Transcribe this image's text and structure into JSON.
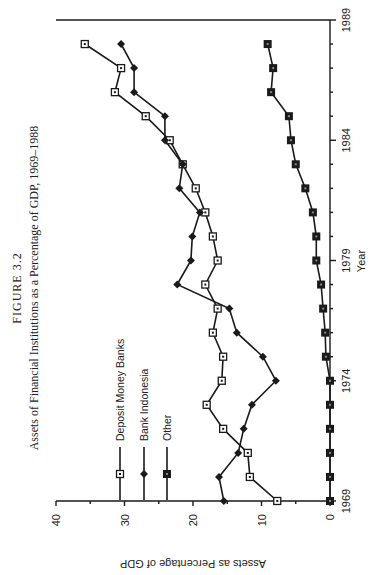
{
  "figure": {
    "number": "FIGURE 3.2",
    "caption": "Assets of Financial Institutions as a Percentage of GDP, 1969–1988"
  },
  "legend": [
    {
      "label": "Deposit Money Banks",
      "marker": "open-square"
    },
    {
      "label": "Bank Indonesia",
      "marker": "filled-diamond"
    },
    {
      "label": "Other",
      "marker": "filled-square"
    }
  ],
  "axes": {
    "xlabel": "Year",
    "ylabel": "Assets as Percentage of GDP",
    "x_ticks": [
      "1969",
      "1974",
      "1979",
      "1984",
      "1989"
    ],
    "y_ticks": [
      "0",
      "10",
      "20",
      "30",
      "40"
    ]
  },
  "chart_data": {
    "type": "line",
    "xlabel": "Year",
    "ylabel": "Assets as Percentage of GDP",
    "xlim": [
      1969,
      1989
    ],
    "ylim": [
      0,
      40
    ],
    "x_ticks": [
      1969,
      1974,
      1979,
      1984,
      1989
    ],
    "y_ticks": [
      0,
      10,
      20,
      30,
      40
    ],
    "grid": false,
    "legend_position": "upper left (inside plot)",
    "orientation_note": "Figure printed rotated 90° counter-clockwise on the page",
    "x": [
      1969,
      1970,
      1971,
      1972,
      1973,
      1974,
      1975,
      1976,
      1977,
      1978,
      1979,
      1980,
      1981,
      1982,
      1983,
      1984,
      1985,
      1986,
      1987,
      1988
    ],
    "series": [
      {
        "name": "Deposit Money Banks",
        "marker": "open-square",
        "values": [
          7.7,
          11.7,
          12.0,
          15.6,
          18.0,
          15.8,
          15.6,
          17.1,
          16.4,
          18.2,
          16.4,
          17.1,
          18.2,
          19.6,
          21.5,
          23.4,
          26.9,
          31.4,
          30.5,
          35.8
        ]
      },
      {
        "name": "Bank Indonesia",
        "marker": "filled-diamond",
        "values": [
          15.5,
          16.2,
          13.4,
          12.6,
          11.4,
          7.9,
          9.8,
          13.6,
          14.7,
          22.3,
          20.3,
          20.1,
          19.0,
          22.0,
          21.5,
          24.1,
          24.1,
          28.6,
          28.6,
          30.5
        ]
      },
      {
        "name": "Other",
        "marker": "filled-square",
        "values": [
          0.0,
          0.0,
          0.0,
          0.0,
          0.0,
          0.0,
          0.6,
          0.7,
          1.0,
          1.3,
          2.0,
          2.0,
          2.5,
          3.6,
          5.0,
          5.7,
          6.0,
          8.6,
          8.3,
          9.1
        ]
      }
    ]
  }
}
